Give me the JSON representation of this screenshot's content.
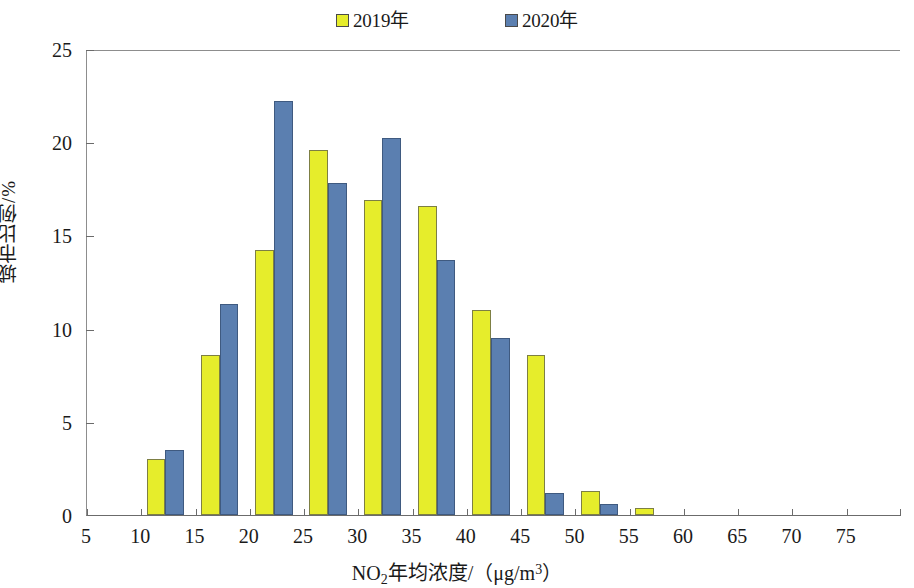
{
  "chart_data": {
    "type": "bar",
    "title": "",
    "subtitle": "",
    "xlabel_parts": {
      "prefix": "NO",
      "subscript": "2",
      "middle": "年均浓度/（μg/m",
      "superscript": "3",
      "suffix": "）"
    },
    "xlabel": "NO2年均浓度/（μg/m3）",
    "ylabel": "城市比例/%",
    "categories": [
      "5",
      "10",
      "15",
      "20",
      "25",
      "30",
      "35",
      "40",
      "45",
      "50",
      "55",
      "60",
      "65",
      "70",
      "75"
    ],
    "xtick_labels": [
      "5",
      "10",
      "15",
      "20",
      "25",
      "30",
      "35",
      "40",
      "45",
      "50",
      "55",
      "60",
      "65",
      "70",
      "75"
    ],
    "ytick_labels": [
      "0",
      "5",
      "10",
      "15",
      "20",
      "25"
    ],
    "ytick_values": [
      0,
      5,
      10,
      15,
      20,
      25
    ],
    "ylim": [
      0,
      25
    ],
    "grid": false,
    "legend_position": "top-center",
    "series": [
      {
        "name": "2019年",
        "color": "#e6ed2b",
        "values": [
          0,
          3.0,
          8.6,
          14.2,
          19.6,
          16.9,
          16.6,
          11.0,
          8.6,
          1.3,
          0.35,
          0,
          0,
          0,
          0
        ]
      },
      {
        "name": "2020年",
        "color": "#5b7fb0",
        "values": [
          0,
          3.5,
          11.3,
          22.2,
          17.8,
          20.2,
          13.7,
          9.5,
          1.2,
          0.6,
          0,
          0,
          0,
          0,
          0
        ]
      }
    ]
  },
  "legend": {
    "entries": [
      {
        "label": "2019年",
        "color": "#e6ed2b"
      },
      {
        "label": "2020年",
        "color": "#5b7fb0"
      }
    ]
  },
  "axes": {
    "x_title": "NO2年均浓度/（μg/m3）",
    "y_title": "城市比例/%"
  }
}
